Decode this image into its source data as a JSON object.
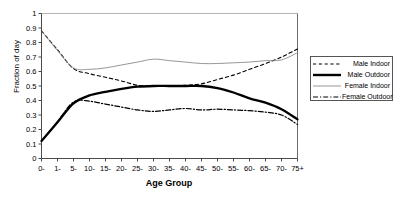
{
  "chart_data": {
    "type": "line",
    "title": "",
    "xlabel": "Age Group",
    "ylabel": "Fraction of day",
    "ylim": [
      0,
      1
    ],
    "ytick_labels": [
      "0",
      "0.1",
      "0.2",
      "0.3",
      "0.4",
      "0.5",
      "0.6",
      "0.7",
      "0.8",
      "0.9",
      "1"
    ],
    "ytick_values": [
      0,
      0.1,
      0.2,
      0.3,
      0.4,
      0.5,
      0.6,
      0.7,
      0.8,
      0.9,
      1
    ],
    "grid": false,
    "legend_position": "right",
    "categories": [
      "0-",
      "1-",
      "5-",
      "10-",
      "15-",
      "20-",
      "25-",
      "30-",
      "35-",
      "40-",
      "45-",
      "50-",
      "55-",
      "60-",
      "65-",
      "70-",
      "75+"
    ],
    "series": [
      {
        "name": "Male Indoor",
        "style": "dashed",
        "color": "#000000",
        "width": 1.1,
        "values": [
          0.88,
          0.75,
          0.62,
          0.585,
          0.56,
          0.535,
          0.505,
          0.5,
          0.5,
          0.505,
          0.515,
          0.545,
          0.575,
          0.615,
          0.655,
          0.7,
          0.755
        ]
      },
      {
        "name": "Male Outdoor",
        "style": "solid-thick",
        "color": "#000000",
        "width": 2.3,
        "values": [
          0.12,
          0.25,
          0.38,
          0.435,
          0.46,
          0.48,
          0.495,
          0.5,
          0.5,
          0.5,
          0.5,
          0.485,
          0.455,
          0.415,
          0.385,
          0.34,
          0.27
        ]
      },
      {
        "name": "Female Indoor",
        "style": "solid-thin",
        "color": "#8a8a8a",
        "width": 0.9,
        "values": [
          0.88,
          0.745,
          0.625,
          0.615,
          0.625,
          0.645,
          0.665,
          0.685,
          0.675,
          0.665,
          0.655,
          0.655,
          0.66,
          0.665,
          0.675,
          0.68,
          0.73
        ]
      },
      {
        "name": "Female Outdoor",
        "style": "dash-dot",
        "color": "#000000",
        "width": 1.2,
        "values": [
          0.12,
          0.255,
          0.39,
          0.395,
          0.375,
          0.355,
          0.335,
          0.325,
          0.335,
          0.345,
          0.335,
          0.34,
          0.335,
          0.33,
          0.32,
          0.3,
          0.235
        ]
      }
    ],
    "top_border_value": 1
  },
  "legend": {
    "items": [
      {
        "label": "Male Indoor"
      },
      {
        "label": "Male Outdoor"
      },
      {
        "label": "Female Indoor"
      },
      {
        "label": "Female Outdoor"
      }
    ]
  }
}
